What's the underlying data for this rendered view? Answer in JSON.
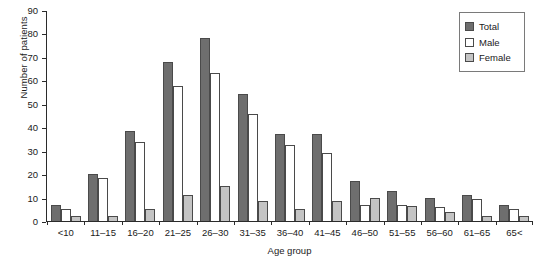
{
  "chart_data": {
    "type": "bar",
    "title": "",
    "xlabel": "Age group",
    "ylabel": "Number of patients",
    "ylim": [
      0,
      90
    ],
    "yticks": [
      0,
      10,
      20,
      30,
      40,
      50,
      60,
      70,
      80,
      90
    ],
    "grid": false,
    "legend_position": "top-right",
    "categories": [
      "<10",
      "11–15",
      "16–20",
      "21–25",
      "26–30",
      "31–35",
      "36–40",
      "41–45",
      "46–50",
      "51–55",
      "56–60",
      "61–65",
      "65<"
    ],
    "series": [
      {
        "name": "Total",
        "color": "#6e6e6e",
        "values": [
          7,
          20,
          38.5,
          68,
          78,
          54,
          37,
          37,
          17,
          13,
          10,
          11,
          7
        ]
      },
      {
        "name": "Male",
        "color": "#ffffff",
        "values": [
          5,
          18.5,
          33.5,
          57.5,
          63,
          45.5,
          32.5,
          29,
          7,
          7,
          6,
          9.5,
          5
        ]
      },
      {
        "name": "Female",
        "color": "#c4c4c4",
        "values": [
          2,
          2,
          5,
          11,
          15,
          8.5,
          5,
          8.5,
          10,
          6.5,
          4,
          2,
          2
        ]
      }
    ]
  }
}
